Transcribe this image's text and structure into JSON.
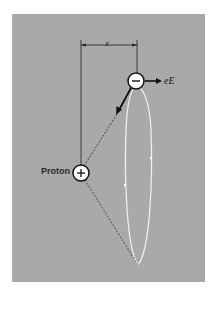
{
  "figure": {
    "background_color": "#a9a9a9",
    "labels": {
      "proton": "Proton",
      "force": "eE",
      "distance": "x"
    },
    "charges": {
      "electron_sign": "−",
      "proton_sign": "+"
    },
    "colors": {
      "orbit": "#f2f2f2",
      "lines": "#222222",
      "particle_fill": "#ffffff"
    }
  }
}
